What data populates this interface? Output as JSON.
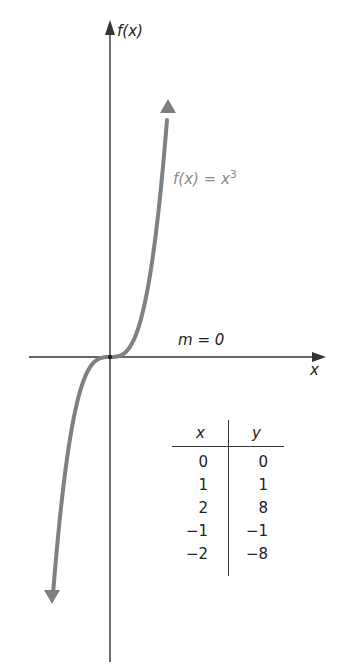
{
  "chart_data": {
    "type": "line",
    "title": "",
    "function": "f(x) = x^3",
    "xlabel": "x",
    "ylabel": "f(x)",
    "annotation": "m = 0",
    "curve_color": "#808080",
    "axis_color": "#333333",
    "table": {
      "headers": [
        "x",
        "y"
      ],
      "rows": [
        {
          "x": "0",
          "y": "0"
        },
        {
          "x": "1",
          "y": "1"
        },
        {
          "x": "2",
          "y": "8"
        },
        {
          "x": "−1",
          "y": "−1"
        },
        {
          "x": "−2",
          "y": "−8"
        }
      ]
    },
    "x": [
      -2,
      -1,
      0,
      1,
      2
    ],
    "series": [
      {
        "name": "f(x) = x^3",
        "values": [
          -8,
          -1,
          0,
          1,
          8
        ]
      }
    ],
    "grid": false
  },
  "labels": {
    "y_axis": "f(x)",
    "x_axis": "x",
    "func_prefix": "f(x) = x",
    "func_exp": "3",
    "slope": "m = 0"
  }
}
